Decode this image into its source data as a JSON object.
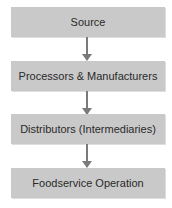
{
  "diagram": {
    "type": "flowchart",
    "direction": "top-to-bottom",
    "nodes": [
      {
        "id": "source",
        "label": "Source"
      },
      {
        "id": "processors",
        "label": "Processors & Manufacturers"
      },
      {
        "id": "distributors",
        "label": "Distributors (Intermediaries)"
      },
      {
        "id": "foodservice",
        "label": "Foodservice Operation"
      }
    ],
    "edges": [
      {
        "from": "source",
        "to": "processors"
      },
      {
        "from": "processors",
        "to": "distributors"
      },
      {
        "from": "distributors",
        "to": "foodservice"
      }
    ],
    "colors": {
      "box": "#c9c9c9",
      "arrow": "#7a7a7a",
      "text": "#2a2a2a"
    }
  }
}
